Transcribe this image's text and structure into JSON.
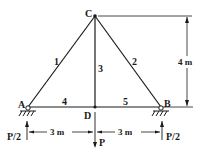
{
  "diagram": {
    "type": "plane-truss",
    "nodes": {
      "A": {
        "label": "A"
      },
      "B": {
        "label": "B"
      },
      "C": {
        "label": "C"
      },
      "D": {
        "label": "D"
      }
    },
    "members": [
      {
        "id": "1",
        "from": "A",
        "to": "C",
        "label": "1"
      },
      {
        "id": "2",
        "from": "C",
        "to": "B",
        "label": "2"
      },
      {
        "id": "3",
        "from": "C",
        "to": "D",
        "label": "3"
      },
      {
        "id": "4",
        "from": "A",
        "to": "D",
        "label": "4"
      },
      {
        "id": "5",
        "from": "D",
        "to": "B",
        "label": "5"
      }
    ],
    "loads": {
      "center": {
        "label": "P",
        "node": "D",
        "direction": "down"
      },
      "reaction_a": {
        "label": "P/2",
        "node": "A",
        "direction": "up"
      },
      "reaction_b": {
        "label": "P/2",
        "node": "B",
        "direction": "up"
      }
    },
    "dimensions": {
      "left_span": "3 m",
      "right_span": "3 m",
      "height": "4 m"
    }
  }
}
